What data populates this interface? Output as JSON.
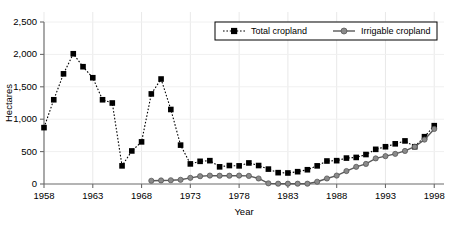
{
  "chart_data": {
    "type": "line",
    "title": "",
    "xlabel": "Year",
    "ylabel": "Hectares",
    "xlim": [
      1958,
      1999
    ],
    "ylim": [
      0,
      2500
    ],
    "grid": true,
    "legend_position": "top-right",
    "xticks": [
      "1958",
      "1963",
      "1968",
      "1973",
      "1978",
      "1983",
      "1988",
      "1993",
      "1998"
    ],
    "xtick_values": [
      1958,
      1963,
      1968,
      1973,
      1978,
      1983,
      1988,
      1993,
      1998
    ],
    "yticks": [
      "0",
      "500",
      "1,000",
      "1,500",
      "2,000",
      "2,500"
    ],
    "ytick_values": [
      0,
      500,
      1000,
      1500,
      2000,
      2500
    ],
    "series": [
      {
        "name": "Total cropland",
        "marker": "square",
        "color": "#000000",
        "linestyle": "dotted",
        "x": [
          1958,
          1959,
          1960,
          1961,
          1962,
          1963,
          1964,
          1965,
          1966,
          1967,
          1968,
          1969,
          1970,
          1971,
          1972,
          1973,
          1974,
          1975,
          1976,
          1977,
          1978,
          1979,
          1980,
          1981,
          1982,
          1983,
          1984,
          1985,
          1986,
          1987,
          1988,
          1989,
          1990,
          1991,
          1992,
          1993,
          1994,
          1995,
          1996,
          1997,
          1998
        ],
        "values": [
          870,
          1300,
          1700,
          2010,
          1810,
          1640,
          1300,
          1250,
          280,
          510,
          650,
          1390,
          1620,
          1150,
          600,
          310,
          350,
          360,
          265,
          285,
          280,
          325,
          285,
          230,
          175,
          170,
          190,
          220,
          280,
          355,
          360,
          400,
          410,
          455,
          535,
          575,
          620,
          665,
          575,
          730,
          900
        ]
      },
      {
        "name": "Irrigable cropland",
        "marker": "circle",
        "color": "#8a8a8a",
        "linestyle": "solid",
        "x": [
          1969,
          1970,
          1971,
          1972,
          1973,
          1974,
          1975,
          1976,
          1977,
          1978,
          1979,
          1980,
          1981,
          1982,
          1983,
          1984,
          1985,
          1986,
          1987,
          1988,
          1989,
          1990,
          1991,
          1992,
          1993,
          1994,
          1995,
          1996,
          1997,
          1998
        ],
        "values": [
          50,
          55,
          58,
          65,
          95,
          120,
          130,
          128,
          128,
          130,
          125,
          85,
          10,
          5,
          5,
          5,
          5,
          35,
          85,
          130,
          200,
          265,
          310,
          395,
          430,
          465,
          510,
          575,
          685,
          850
        ]
      }
    ]
  },
  "legend": {
    "entries": [
      {
        "label": "Total cropland"
      },
      {
        "label": "Irrigable cropland"
      }
    ]
  },
  "axes": {
    "x_title": "Year",
    "y_title": "Hectares"
  }
}
